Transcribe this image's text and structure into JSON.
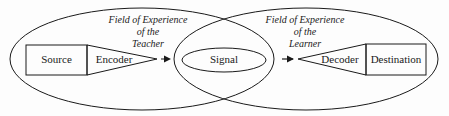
{
  "diagram": {
    "teacher_field": {
      "line1": "Field of Experience",
      "line2": "of the",
      "line3": "Teacher"
    },
    "learner_field": {
      "line1": "Field of Experience",
      "line2": "of the",
      "line3": "Learner"
    },
    "nodes": {
      "source": "Source",
      "encoder": "Encoder",
      "signal": "Signal",
      "decoder": "Decoder",
      "destination": "Destination"
    },
    "colors": {
      "stroke": "#1a1a1a",
      "background": "#fdfdfd"
    }
  }
}
